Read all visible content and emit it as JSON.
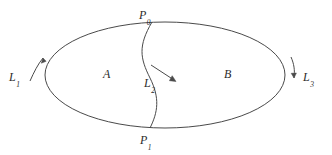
{
  "figure": {
    "type": "topology-diagram",
    "background_color": "#ffffff",
    "stroke_color": "#4a4a4a",
    "text_color": "#2b2b2b",
    "width": 332,
    "height": 155,
    "points": [
      {
        "id": "p0",
        "base": "P",
        "subscript": "0",
        "position": "top"
      },
      {
        "id": "p1",
        "base": "P",
        "subscript": "1",
        "position": "bottom"
      }
    ],
    "curves": [
      {
        "id": "l1",
        "base": "L",
        "subscript": "1",
        "position": "left",
        "arrow": "curved-up"
      },
      {
        "id": "l2",
        "base": "L",
        "subscript": "2",
        "position": "center",
        "arrow": "diagonal-down-right"
      },
      {
        "id": "l3",
        "base": "L",
        "subscript": "3",
        "position": "right",
        "arrow": "curved-down"
      }
    ],
    "regions": [
      {
        "id": "a",
        "label": "A",
        "position": "left"
      },
      {
        "id": "b",
        "label": "B",
        "position": "right"
      }
    ],
    "shapes": {
      "ellipse": {
        "cx": 165,
        "cy": 75,
        "rx": 120,
        "ry": 53
      },
      "dividing_curve": "M 152 22 C 138 46, 140 58, 150 78 C 160 98, 158 112, 150 128"
    }
  }
}
